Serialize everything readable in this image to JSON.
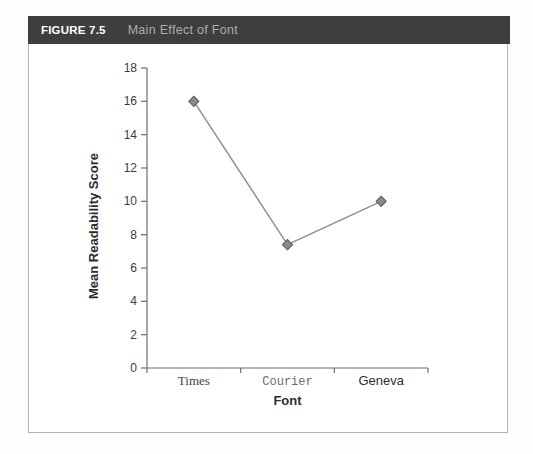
{
  "figure": {
    "label": "FIGURE 7.5",
    "title": "Main Effect of Font",
    "header_bg": "#3e3e3e",
    "label_color": "#ffffff",
    "title_color": "#b5ac9e",
    "border_color": "#b3b3b3"
  },
  "chart_data": {
    "type": "line",
    "categories": [
      "Times",
      "Courier",
      "Geneva"
    ],
    "values": [
      16,
      7.4,
      10
    ],
    "title": "",
    "xlabel": "Font",
    "ylabel": "Mean Readability Score",
    "ylim": [
      0,
      18
    ],
    "yticks": [
      0,
      2,
      4,
      6,
      8,
      10,
      12,
      14,
      16,
      18
    ],
    "grid": false,
    "legend": false,
    "marker": "diamond",
    "line_color": "#8f8f8f",
    "marker_color": "#8a8a8a",
    "marker_edge_color": "#5c5c5c",
    "axis_color": "#6e6e6e"
  }
}
